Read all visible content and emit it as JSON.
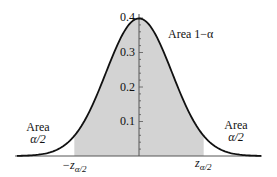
{
  "chart_data": {
    "type": "area",
    "title": "",
    "xlabel": "",
    "ylabel": "",
    "distribution": "standard normal density",
    "y_ticks": [
      0.1,
      0.2,
      0.3,
      0.4
    ],
    "y_tick_labels": [
      "0.1",
      "0.2",
      "0.3",
      "0.4"
    ],
    "ylim": [
      0,
      0.4
    ],
    "xlim": [
      -3.7,
      3.7
    ],
    "shaded_interval": [
      -1.96,
      1.96
    ],
    "x_tick_labels": [
      "−z",
      "z"
    ],
    "x_tick_subscript": "α/2",
    "annotations": {
      "center": "Area 1−α",
      "left_line1": "Area",
      "left_line2": "α/2",
      "right_line1": "Area",
      "right_line2": "α/2"
    },
    "colors": {
      "shade": "#d3d3d3",
      "curve": "#111111",
      "axis": "#333333"
    }
  }
}
